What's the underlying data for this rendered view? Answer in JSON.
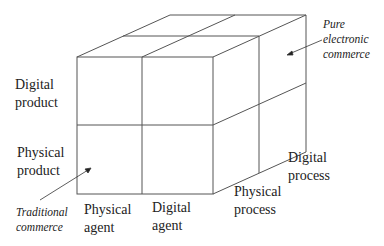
{
  "diagram": {
    "type": "3d-cube",
    "axes": {
      "product": {
        "labels": [
          "Digital product",
          "Physical product"
        ]
      },
      "agent": {
        "labels": [
          "Physical agent",
          "Digital agent"
        ]
      },
      "process": {
        "labels": [
          "Physical process",
          "Digital process"
        ]
      }
    },
    "labels": {
      "digital_product": [
        "Digital",
        "product"
      ],
      "physical_product": [
        "Physical",
        "product"
      ],
      "physical_agent": [
        "Physical",
        "agent"
      ],
      "digital_agent": [
        "Digital",
        "agent"
      ],
      "physical_process": [
        "Physical",
        "process"
      ],
      "digital_process": [
        "Digital",
        "process"
      ]
    },
    "annotations": {
      "pure_ec": [
        "Pure",
        "electronic",
        "commerce"
      ],
      "traditional": [
        "Traditional",
        "commerce"
      ]
    },
    "colors": {
      "line": "#555555",
      "text": "#222222",
      "background": "#ffffff"
    }
  }
}
